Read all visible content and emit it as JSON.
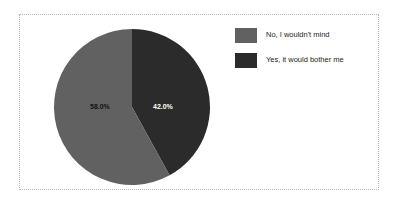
{
  "chart_data": {
    "type": "pie",
    "title": "",
    "categories": [
      "No, I wouldn't mind",
      "Yes, it would bother me"
    ],
    "values": [
      58.0,
      42.0
    ],
    "labels": [
      "58.0%",
      "42.0%"
    ],
    "colors": [
      "#616161",
      "#2b2b2b"
    ],
    "legend_position": "right",
    "grid": false,
    "start_angle_deg": 0,
    "direction": "clockwise",
    "slices": [
      {
        "name": "No, I wouldn't mind",
        "value": 58.0,
        "label": "58.0%",
        "color": "#616161",
        "label_color": "#111111"
      },
      {
        "name": "Yes, it would bother me",
        "value": 42.0,
        "label": "42.0%",
        "color": "#2b2b2b",
        "label_color": "#ffffff"
      }
    ]
  },
  "legend": {
    "items": [
      {
        "label": "No, I wouldn't mind",
        "color": "#616161"
      },
      {
        "label": "Yes, it would bother me",
        "color": "#2b2b2b"
      }
    ]
  },
  "frame": {
    "border_color": "#b8b8b8",
    "background": "#ffffff"
  }
}
